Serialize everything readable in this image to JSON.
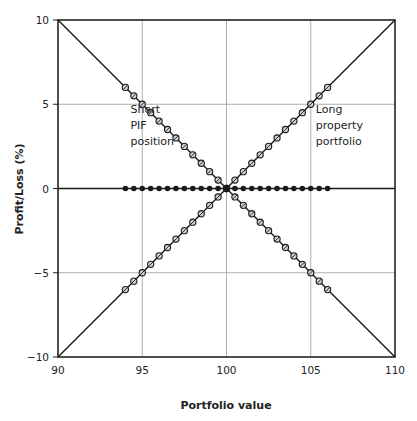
{
  "chart_data": {
    "type": "line",
    "title": "",
    "xlabel": "Portfolio value",
    "ylabel": "Profit/Loss (%)",
    "xlim": [
      90,
      110
    ],
    "ylim": [
      -10,
      10
    ],
    "x_ticks": [
      90,
      95,
      100,
      105,
      110
    ],
    "y_ticks": [
      -10,
      -5,
      0,
      5,
      10
    ],
    "y_tick_labels": [
      "−10",
      "−5",
      "0",
      "5",
      "10"
    ],
    "grid": true,
    "legend": null,
    "annotations": [
      {
        "text": [
          "Short",
          "PIF",
          "position"
        ],
        "x": 94.3,
        "y": 4.5
      },
      {
        "text": [
          "Long",
          "property",
          "portfolio"
        ],
        "x": 105.3,
        "y": 4.5
      }
    ],
    "series": [
      {
        "name": "Long property portfolio",
        "line": {
          "x": [
            90,
            110
          ],
          "y": [
            -10,
            10
          ]
        },
        "marker": "circle-cross",
        "x": [
          94,
          94.5,
          95,
          95.5,
          96,
          96.5,
          97,
          97.5,
          98,
          98.5,
          99,
          99.5,
          100,
          100.5,
          101,
          101.5,
          102,
          102.5,
          103,
          103.5,
          104,
          104.5,
          105,
          105.5,
          106
        ],
        "y": [
          -6,
          -5.5,
          -5,
          -4.5,
          -4,
          -3.5,
          -3,
          -2.5,
          -2,
          -1.5,
          -1,
          -0.5,
          0,
          0.5,
          1,
          1.5,
          2,
          2.5,
          3,
          3.5,
          4,
          4.5,
          5,
          5.5,
          6
        ]
      },
      {
        "name": "Short PIF position",
        "line": {
          "x": [
            90,
            110
          ],
          "y": [
            10,
            -10
          ]
        },
        "marker": "circle-cross",
        "x": [
          94,
          94.5,
          95,
          95.5,
          96,
          96.5,
          97,
          97.5,
          98,
          98.5,
          99,
          99.5,
          100,
          100.5,
          101,
          101.5,
          102,
          102.5,
          103,
          103.5,
          104,
          104.5,
          105,
          105.5,
          106
        ],
        "y": [
          6,
          5.5,
          5,
          4.5,
          4,
          3.5,
          3,
          2.5,
          2,
          1.5,
          1,
          0.5,
          0,
          -0.5,
          -1,
          -1.5,
          -2,
          -2.5,
          -3,
          -3.5,
          -4,
          -4.5,
          -5,
          -5.5,
          -6
        ]
      },
      {
        "name": "Hedged (combined)",
        "line": {
          "x": [
            90,
            110
          ],
          "y": [
            0,
            0
          ]
        },
        "marker": "filled-circle",
        "x": [
          94,
          94.5,
          95,
          95.5,
          96,
          96.5,
          97,
          97.5,
          98,
          98.5,
          99,
          99.5,
          100,
          100.5,
          101,
          101.5,
          102,
          102.5,
          103,
          103.5,
          104,
          104.5,
          105,
          105.5,
          106
        ],
        "y": [
          0,
          0,
          0,
          0,
          0,
          0,
          0,
          0,
          0,
          0,
          0,
          0,
          0,
          0,
          0,
          0,
          0,
          0,
          0,
          0,
          0,
          0,
          0,
          0,
          0
        ]
      }
    ]
  },
  "colors": {
    "axis": "#222222",
    "grid": "#9a9a9a",
    "line": "#1a1a1a",
    "marker_fill": "#cfcfcf"
  }
}
